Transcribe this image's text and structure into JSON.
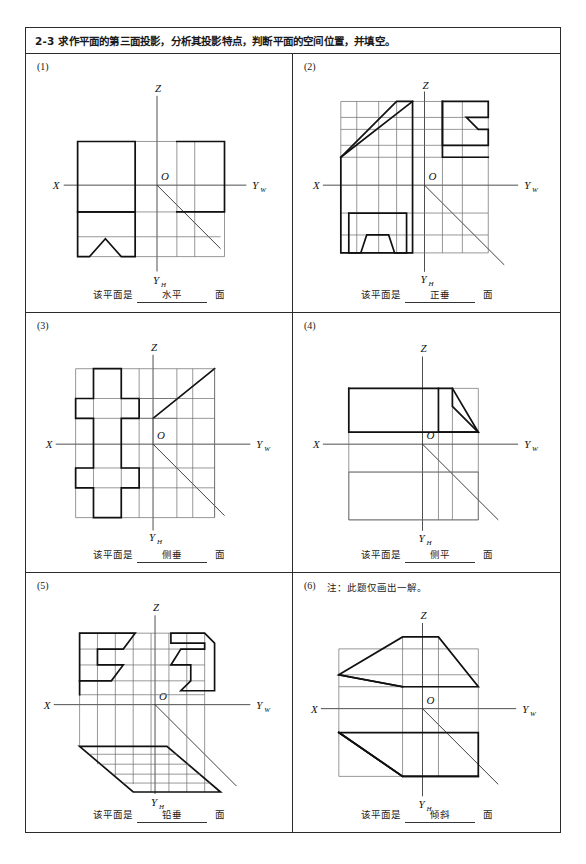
{
  "header": {
    "text": "2-3  求作平面的第三面投影，分析其投影特点，判断平面的空间位置，并填空。"
  },
  "answer_labels": {
    "prefix": "该平面是",
    "suffix": "面"
  },
  "axes": {
    "x": "X",
    "z": "Z",
    "origin": "O",
    "y_w_main": "Y",
    "y_w_sub": "W",
    "y_h_main": "Y",
    "y_h_sub": "H"
  },
  "panels": [
    {
      "number": "(1)",
      "note": "",
      "answer": "水平"
    },
    {
      "number": "(2)",
      "note": "",
      "answer": "正垂"
    },
    {
      "number": "(3)",
      "note": "",
      "answer": "侧垂"
    },
    {
      "number": "(4)",
      "note": "",
      "answer": "侧平"
    },
    {
      "number": "(5)",
      "note": "",
      "answer": "铅垂"
    },
    {
      "number": "(6)",
      "note": "注：此题仅画出一解。",
      "answer": "倾斜"
    }
  ]
}
